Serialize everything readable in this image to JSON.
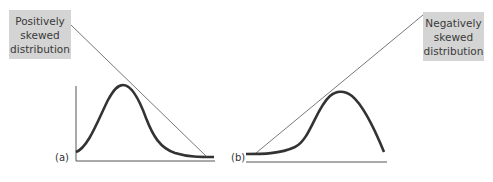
{
  "figure": {
    "panel_a": {
      "label": "(a)",
      "annotation": [
        "Positively",
        "skewed",
        "distribution"
      ]
    },
    "panel_b": {
      "label": "(b)",
      "annotation": [
        "Negatively",
        "skewed",
        "distribution"
      ]
    },
    "colors": {
      "box_fill": "#d4d4d4",
      "curve": "#333333",
      "axis": "#555555",
      "pointer_line": "#555555"
    }
  }
}
